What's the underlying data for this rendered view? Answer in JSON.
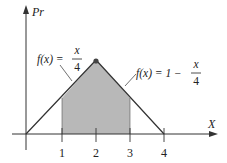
{
  "diagram": {
    "type": "triangular-distribution",
    "y_axis_label": "Pr",
    "x_axis_label": "X",
    "x_ticks": [
      "1",
      "2",
      "3",
      "4"
    ],
    "left_formula": {
      "lhs": "f(x) = ",
      "num": "x",
      "den": "4"
    },
    "right_formula": {
      "lhs": "f(x) = 1 − ",
      "num": "x",
      "den": "4"
    },
    "shaded_region": {
      "from": 1,
      "to": 3
    },
    "colors": {
      "shade": "#b8b8b8",
      "line": "#333333",
      "peak": "#444444"
    }
  }
}
